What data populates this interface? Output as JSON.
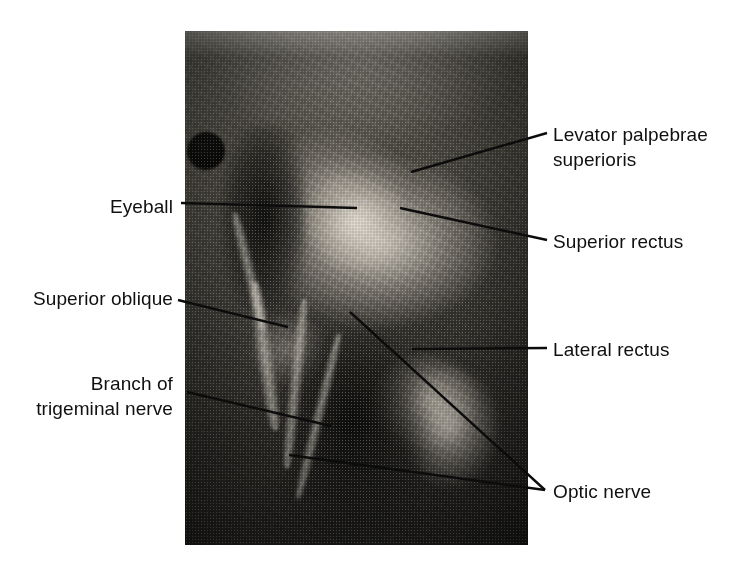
{
  "figure": {
    "kind": "anatomical-dissection-photograph",
    "region": "orbit",
    "background_color": "#ffffff",
    "leader_line_color": "#0c0c0c",
    "text_color": "#101010"
  },
  "photo": {
    "alt_description": "Black and white photograph of a dissected orbit showing extraocular muscles, the eyeball and nerves",
    "x": 185,
    "y": 31,
    "width": 343,
    "height": 514
  },
  "labels": {
    "levator": "Levator palpebrae\nsuperioris",
    "superior_rectus": "Superior rectus",
    "lateral_rectus": "Lateral rectus",
    "optic_nerve": "Optic nerve",
    "eyeball": "Eyeball",
    "superior_oblique": "Superior oblique",
    "trigeminal": "Branch of\ntrigeminal nerve"
  },
  "leaders": [
    {
      "name": "levator-leader",
      "x1": 547,
      "y1": 133,
      "x2": 411,
      "y2": 172
    },
    {
      "name": "superior-rectus-leader",
      "x1": 547,
      "y1": 240,
      "x2": 400,
      "y2": 208
    },
    {
      "name": "lateral-rectus-leader",
      "x1": 547,
      "y1": 348,
      "x2": 412,
      "y2": 349
    },
    {
      "name": "optic-nerve-leader-a",
      "x1": 545,
      "y1": 490,
      "x2": 350,
      "y2": 312
    },
    {
      "name": "optic-nerve-leader-b",
      "x1": 545,
      "y1": 490,
      "x2": 289,
      "y2": 455
    },
    {
      "name": "eyeball-leader",
      "x1": 181,
      "y1": 203,
      "x2": 357,
      "y2": 208
    },
    {
      "name": "superior-oblique-leader",
      "x1": 178,
      "y1": 300,
      "x2": 288,
      "y2": 327
    },
    {
      "name": "trigeminal-leader",
      "x1": 187,
      "y1": 392,
      "x2": 331,
      "y2": 426
    }
  ]
}
